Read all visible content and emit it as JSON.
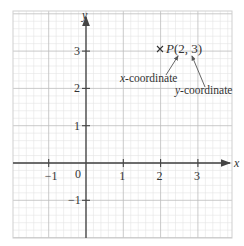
{
  "diagram": {
    "type": "coordinate-plane",
    "axes": {
      "x_label": "x",
      "y_label": "y",
      "x_ticks": [
        {
          "value": -1,
          "label": "−1"
        },
        {
          "value": 1,
          "label": "1"
        },
        {
          "value": 2,
          "label": "2"
        },
        {
          "value": 3,
          "label": "3"
        }
      ],
      "y_ticks": [
        {
          "value": 3,
          "label": "3"
        },
        {
          "value": 2,
          "label": "2"
        },
        {
          "value": 1,
          "label": "1"
        },
        {
          "value": -1,
          "label": "−1"
        }
      ],
      "origin_label": "0",
      "x_range": [
        -2,
        4
      ],
      "y_range": [
        -2,
        3.5
      ]
    },
    "point": {
      "name": "P",
      "x": 2,
      "y": 3,
      "label": "P(2, 3)",
      "marker": "cross"
    },
    "annotations": {
      "x_coordinate": "x-coordinate",
      "y_coordinate": "y-coordinate"
    },
    "colors": {
      "axis": "#444444",
      "grid_major": "#bbbbbb",
      "grid_minor": "#e2e2e2",
      "text": "#333333"
    }
  }
}
